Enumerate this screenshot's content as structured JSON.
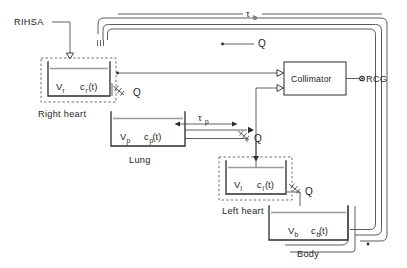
{
  "diagram": {
    "width": 407,
    "height": 268,
    "background_color": "#ffffff",
    "line_color": "#2b2b2b",
    "fluid_line_color": "#9a9a9a",
    "labels": {
      "tracer_input": "RIHSA",
      "transit_time_body": "τ",
      "transit_time_body_sub": "b",
      "transit_time_lung": "τ",
      "transit_time_lung_sub": "p",
      "flow_1": "Q",
      "flow_2": "Q",
      "flow_3": "Q",
      "flow_4": "Q",
      "detector_box": "Collimator",
      "detector_output": "RCG"
    },
    "compartments": [
      {
        "id": "right-heart",
        "name": "Right heart",
        "volume_symbol": "V",
        "volume_sub": "r",
        "conc_symbol": "c",
        "conc_sub": "r",
        "conc_arg": "(t)",
        "dashed_outline": true
      },
      {
        "id": "lung",
        "name": "Lung",
        "volume_symbol": "V",
        "volume_sub": "p",
        "conc_symbol": "c",
        "conc_sub": "p",
        "conc_arg": "(t)",
        "dashed_outline": false
      },
      {
        "id": "left-heart",
        "name": "Left heart",
        "volume_symbol": "V",
        "volume_sub": "l",
        "conc_symbol": "c",
        "conc_sub": "l",
        "conc_arg": "(t)",
        "dashed_outline": true
      },
      {
        "id": "body",
        "name": "Body",
        "volume_symbol": "V",
        "volume_sub": "b",
        "conc_symbol": "c",
        "conc_sub": "b",
        "conc_arg": "(t)",
        "dashed_outline": false
      }
    ]
  }
}
